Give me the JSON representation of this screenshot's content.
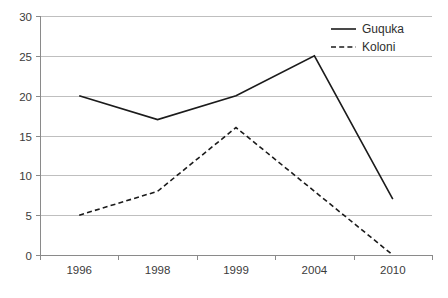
{
  "chart_data": {
    "type": "line",
    "title": "",
    "subtitle": "",
    "xlabel": "",
    "ylabel": "",
    "categories": [
      "1996",
      "1998",
      "1999",
      "2004",
      "2010"
    ],
    "series": [
      {
        "name": "Guquka",
        "values": [
          20,
          17,
          20,
          25,
          7
        ],
        "style": "solid"
      },
      {
        "name": "Koloni",
        "values": [
          5,
          8,
          16,
          8,
          0
        ],
        "style": "dashed"
      }
    ],
    "ylim": [
      0,
      30
    ],
    "yticks": [
      0,
      5,
      10,
      15,
      20,
      25,
      30
    ],
    "ytick_labels": [
      "0",
      "5",
      "10",
      "15",
      "20",
      "25",
      "30"
    ],
    "xtick_labels": [
      "1996",
      "1998",
      "1999",
      "2004",
      "2010"
    ],
    "grid": true,
    "grid_axis": "y",
    "legend": {
      "position": "top-right",
      "entries": [
        {
          "label": "Guquka",
          "style": "solid"
        },
        {
          "label": "Koloni",
          "style": "dashed"
        }
      ]
    },
    "colors": {
      "series": "#1b1b1b",
      "gridline": "#bfbfbf",
      "axis": "#8a8a8a",
      "text": "#3b3b3b",
      "background": "#ffffff"
    }
  }
}
